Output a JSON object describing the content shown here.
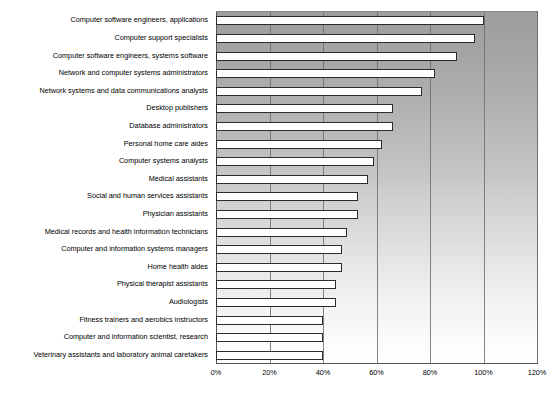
{
  "chart_data": {
    "type": "bar",
    "orientation": "horizontal",
    "title": "",
    "subtitle": "",
    "xlabel": "",
    "ylabel": "",
    "xlim": [
      0,
      120
    ],
    "xtick_labels": [
      "0%",
      "20%",
      "40%",
      "60%",
      "80%",
      "100%",
      "120%"
    ],
    "xticks": [
      0,
      20,
      40,
      60,
      80,
      100,
      120
    ],
    "grid": true,
    "legend": false,
    "legend_position": "none",
    "value_unit": "%",
    "categories": [
      "Computer software engineers, applications",
      "Computer support specialists",
      "Computer software engineers, systems software",
      "Network and computer systems administrators",
      "Network systems and data communications analysts",
      "Desktop publishers",
      "Database administrators",
      "Personal home care aides",
      "Computer systems analysts",
      "Medical assistants",
      "Social and human services assistants",
      "Physician assistants",
      "Medical records and health information technicians",
      "Computer and information systems managers",
      "Home health aides",
      "Physical therapist assistants",
      "Audiologists",
      "Fitness trainers and aerobics instructors",
      "Computer and information scientist, research",
      "Veterinary assistants and laboratory animal caretakers"
    ],
    "values": [
      100,
      97,
      90,
      82,
      77,
      66,
      66,
      62,
      59,
      57,
      53,
      53,
      49,
      47,
      47,
      45,
      45,
      40,
      40,
      40
    ],
    "bar_fill_color": "#ffffff",
    "bar_border_color": "#2b2b2b",
    "plot_background": "vertical gray-to-white gradient",
    "plot_background_top_color": "#9d9d9d",
    "plot_background_bottom_color": "#ffffff",
    "gridline_color": "#6f6f6f",
    "axis_color": "#555555",
    "text_color": "#000000"
  }
}
